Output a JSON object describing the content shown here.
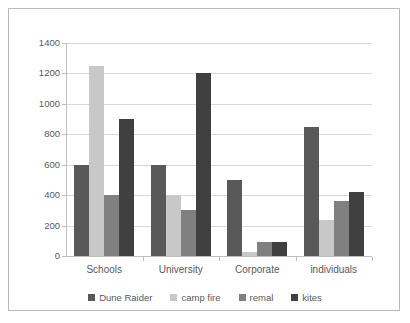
{
  "chart_data": {
    "type": "bar",
    "title": "",
    "subtitle": "",
    "xlabel": "",
    "ylabel": "",
    "categories": [
      "Schools",
      "University",
      "Corporate",
      "individuals"
    ],
    "series": [
      {
        "name": "Dune Raider",
        "color": "#595959",
        "values": [
          600,
          600,
          500,
          850
        ]
      },
      {
        "name": "camp fire",
        "color": "#c8c8c8",
        "values": [
          1250,
          400,
          25,
          240
        ]
      },
      {
        "name": "remal",
        "color": "#808080",
        "values": [
          400,
          300,
          90,
          360
        ]
      },
      {
        "name": "kites",
        "color": "#404040",
        "values": [
          900,
          1200,
          90,
          420
        ]
      }
    ],
    "ylim": [
      0,
      1400
    ],
    "yticks": [
      0,
      200,
      400,
      600,
      800,
      1000,
      1200,
      1400
    ],
    "ytick_labels": [
      "0",
      "200",
      "400",
      "600",
      "800",
      "1000",
      "1200",
      "1400"
    ],
    "grid": true,
    "legend_position": "bottom",
    "axis_color": "#bfbfbf",
    "grid_color": "#d9d9d9",
    "text_color": "#595959",
    "background": "#ffffff",
    "border_color": "#b9b9bb"
  }
}
